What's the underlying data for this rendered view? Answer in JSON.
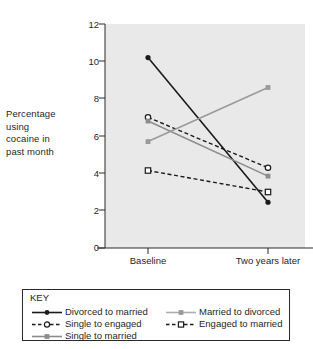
{
  "chart_data": {
    "type": "line",
    "title": "",
    "xlabel": "",
    "ylabel": "Percentage using cocaine in past month",
    "categories": [
      "Baseline",
      "Two years later"
    ],
    "x_tick_labels": [
      "Baseline",
      "Two years later"
    ],
    "y_tick_labels": [
      "0",
      "2",
      "4",
      "6",
      "8",
      "10",
      "12"
    ],
    "y_ticks": [
      0,
      2,
      4,
      6,
      8,
      10,
      12
    ],
    "ylim": [
      0,
      12
    ],
    "grid": false,
    "legend_position": "below-plot",
    "legend_title": "KEY",
    "plot_background": "#e9e9e9",
    "series": [
      {
        "name": "Divorced to married",
        "values": [
          10.2,
          2.45
        ],
        "color": "#1a1a1a",
        "line_style": "solid",
        "marker": "filled-circle"
      },
      {
        "name": "Single to engaged",
        "values": [
          7.0,
          4.3
        ],
        "color": "#1a1a1a",
        "line_style": "dashed",
        "marker": "open-circle"
      },
      {
        "name": "Single to married",
        "values": [
          6.8,
          3.85
        ],
        "color": "#8c8c8c",
        "line_style": "solid",
        "marker": "filled-square"
      },
      {
        "name": "Married to divorced",
        "values": [
          5.7,
          8.6
        ],
        "color": "#9a9a9a",
        "line_style": "solid",
        "marker": "filled-square"
      },
      {
        "name": "Engaged to married",
        "values": [
          4.15,
          3.0
        ],
        "color": "#1a1a1a",
        "line_style": "dashed",
        "marker": "open-square"
      }
    ]
  },
  "axes": {
    "y_title": "Percentage using cocaine in past month",
    "y_title_lines": [
      "Percentage",
      "using",
      "cocaine in",
      "past month"
    ]
  },
  "legend": {
    "title": "KEY",
    "entries": [
      {
        "label": "Divorced to married"
      },
      {
        "label": "Single to engaged"
      },
      {
        "label": "Single to married"
      },
      {
        "label": "Married to divorced"
      },
      {
        "label": "Engaged to married"
      }
    ]
  }
}
